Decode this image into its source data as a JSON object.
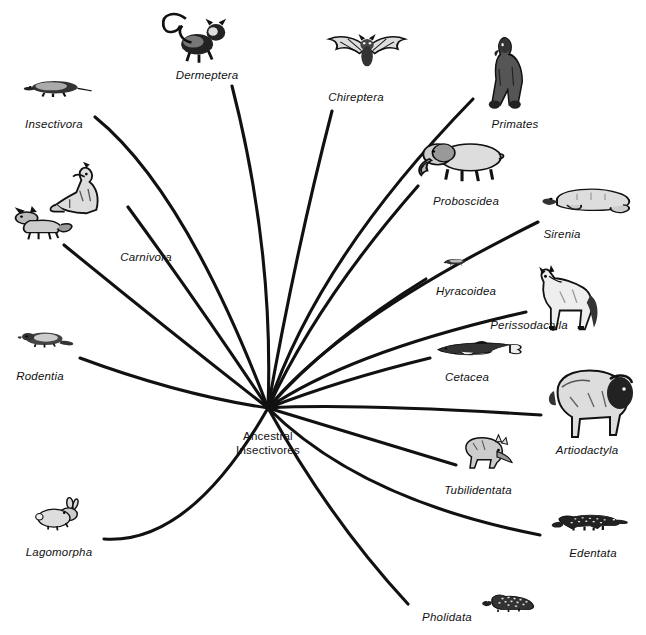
{
  "diagram": {
    "background_color": "#ffffff",
    "line_color": "#111111",
    "root": {
      "name": "root-node",
      "line1": "Ancestral",
      "line2": "Insectivores",
      "x": 268,
      "y": 443
    },
    "hub": {
      "x": 268,
      "y": 408
    },
    "taxa": [
      {
        "id": "dermeptera",
        "label": "Dermeptera",
        "icon": "lemur-icon",
        "label_x": 207,
        "label_y": 75,
        "art_x": 199,
        "art_y": 40,
        "art_w": 90,
        "art_h": 66,
        "tip_x": 232,
        "tip_y": 86,
        "ctrl_x": 274,
        "ctrl_y": 250
      },
      {
        "id": "insectivora",
        "label": "Insectivora",
        "icon": "shrew-icon",
        "label_x": 54,
        "label_y": 124,
        "art_x": 60,
        "art_y": 97,
        "art_w": 84,
        "art_h": 40,
        "tip_x": 95,
        "tip_y": 117,
        "ctrl_x": 185,
        "ctrl_y": 190
      },
      {
        "id": "carnivora-wolf",
        "label": "Carnivora",
        "icon": "wolf-icon",
        "label_x": 146,
        "label_y": 257,
        "art_x": 88,
        "art_y": 195,
        "art_w": 80,
        "art_h": 68,
        "tip_x": 128,
        "tip_y": 207,
        "ctrl_x": 196,
        "ctrl_y": 300
      },
      {
        "id": "carnivora-fox",
        "label": "",
        "icon": "fox-icon",
        "label_x": 0,
        "label_y": 0,
        "art_x": 42,
        "art_y": 228,
        "art_w": 82,
        "art_h": 52,
        "tip_x": 64,
        "tip_y": 245,
        "ctrl_x": 168,
        "ctrl_y": 330
      },
      {
        "id": "rodentia",
        "label": "Rodentia",
        "icon": "beaver-icon",
        "label_x": 40,
        "label_y": 376,
        "art_x": 49,
        "art_y": 348,
        "art_w": 72,
        "art_h": 38,
        "tip_x": 80,
        "tip_y": 358,
        "ctrl_x": 180,
        "ctrl_y": 395
      },
      {
        "id": "lagomorpha",
        "label": "Lagomorpha",
        "icon": "rabbit-icon",
        "label_x": 59,
        "label_y": 552,
        "art_x": 70,
        "art_y": 520,
        "art_w": 70,
        "art_h": 50,
        "tip_x": 104,
        "tip_y": 539,
        "ctrl_x": 190,
        "ctrl_y": 545
      },
      {
        "id": "chireptera",
        "label": "Chireptera",
        "icon": "bat-icon",
        "label_x": 356,
        "label_y": 97,
        "art_x": 369,
        "art_y": 57,
        "art_w": 92,
        "art_h": 56,
        "tip_x": 332,
        "tip_y": 111,
        "ctrl_x": 296,
        "ctrl_y": 250
      },
      {
        "id": "primates",
        "label": "Primates",
        "icon": "gorilla-icon",
        "label_x": 515,
        "label_y": 124,
        "art_x": 515,
        "art_y": 72,
        "art_w": 70,
        "art_h": 82,
        "tip_x": 473,
        "tip_y": 99,
        "ctrl_x": 318,
        "ctrl_y": 258
      },
      {
        "id": "proboscidea",
        "label": "Proboscidea",
        "icon": "elephant-icon",
        "label_x": 466,
        "label_y": 201,
        "art_x": 460,
        "art_y": 167,
        "art_w": 98,
        "art_h": 58,
        "tip_x": 418,
        "tip_y": 186,
        "ctrl_x": 318,
        "ctrl_y": 300
      },
      {
        "id": "sirenia",
        "label": "Sirenia",
        "icon": "manatee-icon",
        "label_x": 562,
        "label_y": 234,
        "art_x": 585,
        "art_y": 208,
        "art_w": 96,
        "art_h": 48,
        "tip_x": 538,
        "tip_y": 222,
        "ctrl_x": 340,
        "ctrl_y": 320
      },
      {
        "id": "hyracoidea",
        "label": "Hyracoidea",
        "icon": "hyrax-icon",
        "label_x": 466,
        "label_y": 291,
        "art_x": 466,
        "art_y": 270,
        "art_w": 48,
        "art_h": 24,
        "tip_x": 426,
        "tip_y": 279,
        "ctrl_x": 330,
        "ctrl_y": 338
      },
      {
        "id": "perissodactyla",
        "label": "Perissodactyla",
        "icon": "horse-icon",
        "label_x": 529,
        "label_y": 325,
        "art_x": 567,
        "art_y": 300,
        "art_w": 86,
        "art_h": 74,
        "tip_x": 526,
        "tip_y": 312,
        "ctrl_x": 350,
        "ctrl_y": 352
      },
      {
        "id": "cetacea",
        "label": "Cetacea",
        "icon": "dolphin-icon",
        "label_x": 467,
        "label_y": 377,
        "art_x": 478,
        "art_y": 358,
        "art_w": 96,
        "art_h": 38,
        "tip_x": 430,
        "tip_y": 358,
        "ctrl_x": 340,
        "ctrl_y": 380
      },
      {
        "id": "artiodactyla",
        "label": "Artiodactyla",
        "icon": "bison-icon",
        "label_x": 587,
        "label_y": 450,
        "art_x": 588,
        "art_y": 400,
        "art_w": 96,
        "art_h": 78,
        "tip_x": 541,
        "tip_y": 415,
        "ctrl_x": 350,
        "ctrl_y": 403
      },
      {
        "id": "tubilidentata",
        "label": "Tubilidentata",
        "icon": "aardvark-icon",
        "label_x": 478,
        "label_y": 490,
        "art_x": 494,
        "art_y": 459,
        "art_w": 72,
        "art_h": 54,
        "tip_x": 456,
        "tip_y": 465,
        "ctrl_x": 340,
        "ctrl_y": 430
      },
      {
        "id": "edentata",
        "label": "Edentata",
        "icon": "anteater-icon",
        "label_x": 593,
        "label_y": 553,
        "art_x": 590,
        "art_y": 530,
        "art_w": 88,
        "art_h": 38,
        "tip_x": 540,
        "tip_y": 535,
        "ctrl_x": 360,
        "ctrl_y": 500
      },
      {
        "id": "pholidata",
        "label": "Pholidata",
        "icon": "pangolin-icon",
        "label_x": 447,
        "label_y": 617,
        "art_x": 516,
        "art_y": 611,
        "art_w": 72,
        "art_h": 42,
        "tip_x": 408,
        "tip_y": 604,
        "ctrl_x": 330,
        "ctrl_y": 520
      }
    ]
  }
}
